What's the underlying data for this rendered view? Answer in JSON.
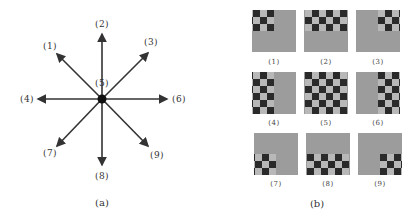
{
  "panel_a": {
    "caption": "(a)",
    "center": {
      "x": 102,
      "y": 99,
      "label": "(5)"
    },
    "directions": [
      {
        "id": 1,
        "label": "(1)",
        "end": [
          57,
          54
        ],
        "label_pos": [
          50,
          46
        ]
      },
      {
        "id": 2,
        "label": "(2)",
        "end": [
          102,
          34
        ],
        "label_pos": [
          102,
          24
        ]
      },
      {
        "id": 3,
        "label": "(3)",
        "end": [
          148,
          53
        ],
        "label_pos": [
          151,
          42
        ]
      },
      {
        "id": 4,
        "label": "(4)",
        "end": [
          38,
          99
        ],
        "label_pos": [
          27,
          99
        ]
      },
      {
        "id": 5,
        "label": "(5)",
        "end": null,
        "label_pos": [
          102,
          83
        ]
      },
      {
        "id": 6,
        "label": "(6)",
        "end": [
          167,
          99
        ],
        "label_pos": [
          179,
          99
        ]
      },
      {
        "id": 7,
        "label": "(7)",
        "end": [
          57,
          146
        ],
        "label_pos": [
          50,
          153
        ]
      },
      {
        "id": 8,
        "label": "(8)",
        "end": [
          102,
          165
        ],
        "label_pos": [
          102,
          176
        ]
      },
      {
        "id": 9,
        "label": "(9)",
        "end": [
          148,
          146
        ],
        "label_pos": [
          157,
          155
        ]
      }
    ],
    "caption_pos": [
      102,
      202
    ],
    "colors": {
      "arrow": "#333333",
      "center_dot": "#111111"
    }
  },
  "panel_b": {
    "caption": "(b)",
    "caption_pos": [
      317,
      203
    ],
    "tiles": [
      {
        "label": "(1)",
        "x": 252,
        "y": 10,
        "shift": [
          -3,
          -3
        ],
        "label_pos": [
          274,
          62
        ]
      },
      {
        "label": "(2)",
        "x": 304,
        "y": 10,
        "shift": [
          0,
          -3
        ],
        "label_pos": [
          326,
          62
        ]
      },
      {
        "label": "(3)",
        "x": 356,
        "y": 10,
        "shift": [
          3,
          -3
        ],
        "label_pos": [
          378,
          62
        ]
      },
      {
        "label": "(4)",
        "x": 252,
        "y": 72,
        "shift": [
          -3,
          0
        ],
        "label_pos": [
          274,
          123
        ]
      },
      {
        "label": "(5)",
        "x": 304,
        "y": 72,
        "shift": [
          0,
          0
        ],
        "label_pos": [
          326,
          123
        ]
      },
      {
        "label": "(6)",
        "x": 356,
        "y": 72,
        "shift": [
          3,
          0
        ],
        "label_pos": [
          378,
          123
        ]
      },
      {
        "label": "(7)",
        "x": 254,
        "y": 133,
        "shift": [
          -3,
          3
        ],
        "label_pos": [
          276,
          184
        ]
      },
      {
        "label": "(8)",
        "x": 306,
        "y": 133,
        "shift": [
          0,
          3
        ],
        "label_pos": [
          328,
          184
        ]
      },
      {
        "label": "(9)",
        "x": 358,
        "y": 133,
        "shift": [
          3,
          3
        ],
        "label_pos": [
          380,
          184
        ]
      }
    ],
    "colors": {
      "tile_bg": "#9c9c9c",
      "dark": "#2a2a2a",
      "light": "#b8b8b8"
    }
  }
}
